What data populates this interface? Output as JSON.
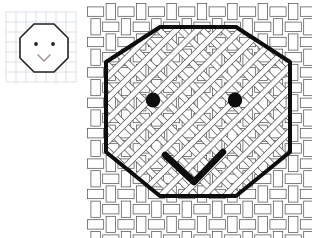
{
  "document": {
    "title": "Octagon Face — grid sketch and woven basket rendering",
    "background_color": "#ffffff",
    "width": 312,
    "height": 238
  },
  "palette": {
    "ink": "#1a1a1a",
    "outline": "#111111",
    "weave_stroke": "#4a4a4a",
    "weave_fill": "#ffffff",
    "grid_line": "#c8d0dc",
    "grid_line_minor": "#dde3ec",
    "mouth_tint": "#b9a7b0",
    "page": "#ffffff"
  },
  "thumbnail": {
    "name": "octagon-face-sketch",
    "label": "",
    "grid": {
      "visible": true,
      "cell_size": 10,
      "color": "#c8d0dc",
      "origin_x": 6,
      "origin_y": 12,
      "cols": 7,
      "rows": 7
    },
    "figure": {
      "shape": "octagon",
      "stroke": "#222222",
      "stroke_width": 1.6,
      "fill": "#ffffff",
      "center_x": 44,
      "center_y": 48,
      "radius": 26,
      "rotation_deg": 22.5
    },
    "eyes": [
      {
        "name": "left-eye",
        "cx": 36,
        "cy": 44,
        "r": 1.9,
        "fill": "#222222"
      },
      {
        "name": "right-eye",
        "cx": 53,
        "cy": 44,
        "r": 1.9,
        "fill": "#222222"
      }
    ],
    "mouth": {
      "name": "mouth",
      "type": "v-shape",
      "points": "38,55 44,61 50,55",
      "stroke": "#9b8a92",
      "stroke_width": 1.4
    }
  },
  "weave_figure": {
    "name": "octagon-face-weave",
    "description": "Large octagon face rendered over an interlaced basket-weave grid with a diagonal lattice inside the octagon.",
    "weave": {
      "cell": 15.2,
      "bar_thickness": 9.4,
      "stroke": "#4a4a4a",
      "stroke_width": 0.7,
      "fill": "#ffffff",
      "cols": 15,
      "rows": 16,
      "origin_x": 2,
      "origin_y": 4
    },
    "lattice": {
      "visible": true,
      "stroke": "#555555",
      "stroke_width": 0.8,
      "fill": "#ffffff",
      "band_thickness": 5.0,
      "angle_deg": 45,
      "spacing": 21.5,
      "clipped_to_octagon": true
    },
    "octagon": {
      "stroke": "#0d0d0d",
      "stroke_width": 4.0,
      "center_x": 112,
      "center_y": 116,
      "radius_x": 92,
      "radius_y": 100,
      "rotation_deg": 22.5,
      "vertices": [
        [
          74,
          27
        ],
        [
          150,
          27
        ],
        [
          204,
          62
        ],
        [
          204,
          152
        ],
        [
          150,
          196
        ],
        [
          74,
          196
        ],
        [
          20,
          152
        ],
        [
          20,
          62
        ]
      ]
    },
    "eyes": [
      {
        "name": "left-eye",
        "cx": 67,
        "cy": 100,
        "rx": 7.2,
        "ry": 7.6,
        "fill": "#0d0d0d"
      },
      {
        "name": "right-eye",
        "cx": 149,
        "cy": 100,
        "rx": 7.2,
        "ry": 7.6,
        "fill": "#0d0d0d"
      }
    ],
    "mouth": {
      "name": "mouth",
      "type": "v-shape",
      "points": "79,155 108,182 137,152",
      "stroke": "#0d0d0d",
      "stroke_width": 6.5
    }
  }
}
